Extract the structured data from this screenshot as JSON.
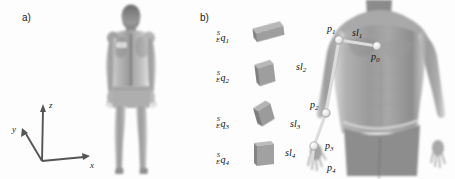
{
  "figure": {
    "background_color": "#fdfdfd",
    "width": 455,
    "height": 179
  },
  "panels": [
    {
      "id": "a",
      "label": "a)",
      "caption_x": 22,
      "caption_y": 12,
      "description": "Full-body rear-view human avatar with a single sensor patch on the left shoulder blade, shown with a world coordinate frame."
    },
    {
      "id": "b",
      "label": "b)",
      "caption_x": 200,
      "caption_y": 12,
      "description": "Column of four IMU sensor boxes with orientation quaternion labels, beside a front-view torso annotated with arm joint points and segment lengths."
    }
  ],
  "axes": {
    "name": "world-coordinate-frame",
    "origin": {
      "x": 42,
      "y": 161
    },
    "arrows": [
      {
        "axis": "z",
        "label": "z",
        "tip_x": 43,
        "tip_y": 106,
        "label_x": 49,
        "label_y": 100
      },
      {
        "axis": "x",
        "label": "x",
        "tip_x": 88,
        "tip_y": 157,
        "label_x": 90,
        "label_y": 160
      },
      {
        "axis": "y",
        "label": "y",
        "tip_x": 22,
        "tip_y": 130,
        "label_x": 12,
        "label_y": 124
      }
    ],
    "color": "#4a4a4a"
  },
  "sensors": {
    "title": "imu-sensor-column",
    "box_fill": "#9c9c9c",
    "box_top": "#b4b4b4",
    "box_side": "#7f7f7f",
    "items": [
      {
        "index": 1,
        "label_pre_sup": "S",
        "label_pre_sub": "E",
        "symbol": "q",
        "sub": "1",
        "label_x": 216,
        "label_y": 30,
        "box_x": 249,
        "box_y": 25,
        "box_w": 32,
        "box_h": 14,
        "rotate": -9,
        "skew": -14
      },
      {
        "index": 2,
        "label_pre_sup": "S",
        "label_pre_sub": "E",
        "symbol": "q",
        "sub": "2",
        "label_x": 216,
        "label_y": 70,
        "box_x": 252,
        "box_y": 62,
        "box_w": 21,
        "box_h": 24,
        "rotate": -8,
        "skew": -6
      },
      {
        "index": 3,
        "label_pre_sup": "S",
        "label_pre_sub": "E",
        "symbol": "q",
        "sub": "3",
        "label_x": 216,
        "label_y": 116,
        "box_x": 250,
        "box_y": 105,
        "box_w": 19,
        "box_h": 22,
        "rotate": -17,
        "skew": -9
      },
      {
        "index": 4,
        "label_pre_sup": "S",
        "label_pre_sub": "E",
        "symbol": "q",
        "sub": "4",
        "label_x": 216,
        "label_y": 152,
        "box_x": 252,
        "box_y": 140,
        "box_w": 22,
        "box_h": 26,
        "rotate": 0,
        "skew": 0
      }
    ]
  },
  "skeleton": {
    "title": "arm-kinematic-chain",
    "marker_color": "#e8e8e8",
    "marker_stroke": "#8a8a8a",
    "link_color": "#d8d8d8",
    "points": [
      {
        "id": "p0",
        "symbol": "p",
        "sub": "0",
        "x": 377,
        "y": 46,
        "label_x": 371,
        "label_y": 52,
        "anatomy": "sternum"
      },
      {
        "id": "p1",
        "symbol": "p",
        "sub": "1",
        "x": 339,
        "y": 40,
        "label_x": 327,
        "label_y": 24,
        "anatomy": "shoulder"
      },
      {
        "id": "p2",
        "symbol": "p",
        "sub": "2",
        "x": 326,
        "y": 113,
        "label_x": 310,
        "label_y": 100,
        "anatomy": "elbow"
      },
      {
        "id": "p3",
        "symbol": "p",
        "sub": "3",
        "x": 314,
        "y": 146,
        "label_x": 325,
        "label_y": 141,
        "anatomy": "wrist"
      },
      {
        "id": "p4",
        "symbol": "p",
        "sub": "4",
        "x": 312,
        "y": 160,
        "label_x": 327,
        "label_y": 163,
        "anatomy": "hand"
      }
    ],
    "segments": [
      {
        "id": "sl1",
        "symbol": "sl",
        "sub": "1",
        "from": "p1",
        "to": "p0",
        "label_x": 352,
        "label_y": 28
      },
      {
        "id": "sl2",
        "symbol": "sl",
        "sub": "2",
        "from": "p1",
        "to": "p2",
        "label_x": 296,
        "label_y": 62
      },
      {
        "id": "sl3",
        "symbol": "sl",
        "sub": "3",
        "from": "p2",
        "to": "p3",
        "label_x": 290,
        "label_y": 119
      },
      {
        "id": "sl4",
        "symbol": "sl",
        "sub": "4",
        "from": "p3",
        "to": "p4",
        "label_x": 285,
        "label_y": 148
      }
    ]
  },
  "avatar_a": {
    "name": "rear-view-body-render",
    "x": 96,
    "y": 6,
    "w": 70,
    "h": 168,
    "patch": {
      "x": 116,
      "y": 42,
      "w": 11,
      "h": 6
    }
  },
  "avatar_b": {
    "name": "front-view-torso-render",
    "x": 330,
    "y": 0,
    "w": 112,
    "h": 179
  }
}
